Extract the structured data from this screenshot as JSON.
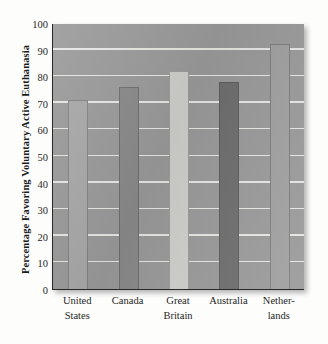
{
  "chart_data": {
    "type": "bar",
    "title": "",
    "xlabel": "",
    "ylabel": "Percentage Favoring Voluntary Active Euthanasia",
    "categories": [
      "United States",
      "Canada",
      "Great Britain",
      "Australia",
      "Netherlands"
    ],
    "category_lines": [
      [
        "United",
        "States"
      ],
      [
        "Canada",
        ""
      ],
      [
        "Great",
        "Britain"
      ],
      [
        "Australia",
        ""
      ],
      [
        "Nether-",
        "lands"
      ]
    ],
    "values": [
      71,
      76,
      82,
      78,
      92
    ],
    "bar_colors": [
      "#a8a8a8",
      "#8a8a8a",
      "#cfcfcb",
      "#6e6e6e",
      "#a0a0a0"
    ],
    "ylim": [
      0,
      100
    ],
    "yticks": [
      0,
      10,
      20,
      30,
      40,
      50,
      60,
      70,
      80,
      90,
      100
    ],
    "ytick_labels": [
      "0",
      "10",
      "20",
      "30",
      "40",
      "50",
      "60",
      "70",
      "80",
      "90",
      "100"
    ],
    "grid": true,
    "grid_axis": "y",
    "legend": "none",
    "plot_background": "#9a9a9a",
    "gridline_color": "#efefec",
    "axis_color": "#2a2a2a"
  }
}
